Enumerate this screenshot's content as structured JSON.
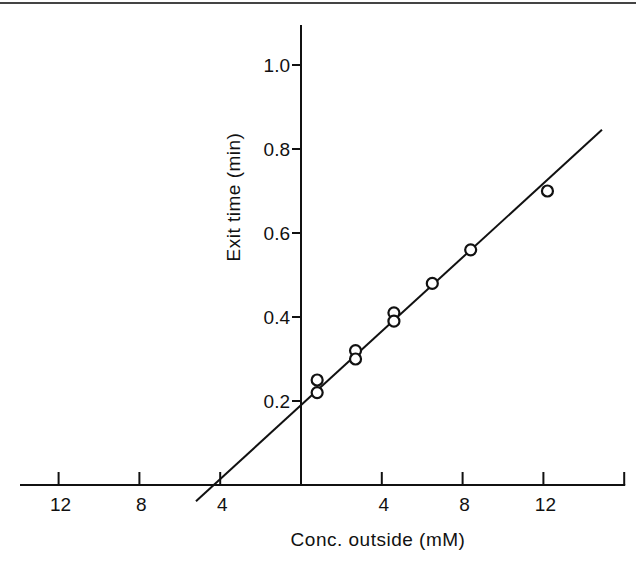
{
  "chart_data": {
    "type": "scatter",
    "title": "",
    "xlabel": "Conc. outside (mM)",
    "ylabel": "Exit time (min)",
    "xlim": [
      -14,
      16
    ],
    "ylim": [
      0,
      1.1
    ],
    "x_ticks": [
      -12,
      -8,
      -4,
      4,
      8,
      12,
      16
    ],
    "x_tick_labels": [
      "12",
      "8",
      "4",
      "4",
      "8",
      "12",
      ""
    ],
    "y_ticks": [
      0.2,
      0.4,
      0.6,
      0.8,
      1.0
    ],
    "y_tick_labels": [
      "0.2",
      "0.4",
      "0.6",
      "0.8",
      "1.0"
    ],
    "grid": false,
    "legend": null,
    "marker": "open-circle",
    "series": [
      {
        "name": "measured",
        "points": [
          {
            "x": 0.8,
            "y": 0.25
          },
          {
            "x": 0.8,
            "y": 0.22
          },
          {
            "x": 2.7,
            "y": 0.32
          },
          {
            "x": 2.7,
            "y": 0.3
          },
          {
            "x": 4.6,
            "y": 0.41
          },
          {
            "x": 4.6,
            "y": 0.39
          },
          {
            "x": 6.5,
            "y": 0.48
          },
          {
            "x": 8.4,
            "y": 0.56
          },
          {
            "x": 12.2,
            "y": 0.7
          }
        ]
      }
    ],
    "fit_line": {
      "name": "linear fit",
      "slope": 0.044,
      "intercept": 0.19,
      "x_start": -5.2,
      "x_end": 14.9
    },
    "colors": {
      "ink": "#111111",
      "background": "#ffffff"
    }
  }
}
